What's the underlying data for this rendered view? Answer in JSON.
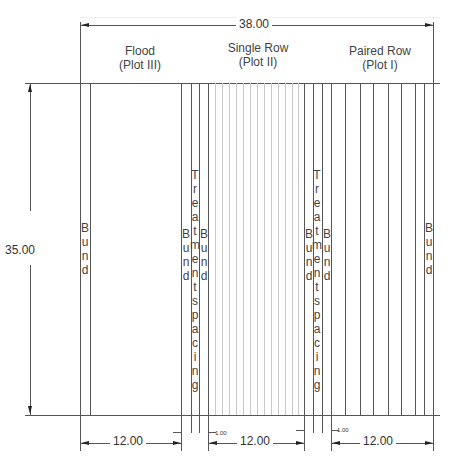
{
  "dimensions": {
    "total_width": "38.00",
    "total_height": "35.00",
    "plot_width_1": "12.00",
    "plot_width_2": "12.00",
    "plot_width_3": "12.00",
    "spacing_1": "1.00",
    "spacing_2": "1.00"
  },
  "plots": [
    {
      "name": "Flood",
      "sub": "(Plot III)"
    },
    {
      "name": "Single Row",
      "sub": "(Plot II)"
    },
    {
      "name": "Paired Row",
      "sub": "(Plot I)"
    }
  ],
  "labels": {
    "bund": "Bund",
    "treatment_spacing": "Treatment spacing"
  },
  "colors": {
    "line": "#555555",
    "thin_line": "#c8c8c8"
  }
}
